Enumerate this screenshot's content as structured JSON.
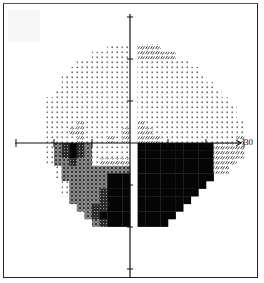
{
  "chart_data": {
    "type": "heatmap",
    "title": "",
    "subtitle": "",
    "xlabel": "",
    "ylabel": "",
    "axis_range_degrees": [
      -30,
      30
    ],
    "tick_spacing_degrees": 10,
    "tick_labels": [
      "30"
    ],
    "grid": false,
    "legend": [],
    "cell_size_px": 7.6,
    "origin_px": [
      130,
      143
    ],
    "col_start": -15,
    "row_start": -17,
    "tone_key": {
      ".": "empty",
      "d": "light-dots (normal sensitivity)",
      "s": "sparse hatch (mild depression)",
      "h": "medium crosshatch (moderate depression)",
      "g": "dark grey (severe depression)",
      "b": "black (absolute defect)"
    },
    "rows": [
      "..............................",
      "..............................",
      "..............................",
      "..............................",
      "............ddd.sss...........",
      "..........ddddd.sssss.........",
      "........ddddddd.ddddddd.......",
      ".......dddddddd.dddddddd......",
      "......ddddddddd.ddddddddd.....",
      "......ddddddddd.dddddddddd....",
      ".....dddddddddd.ddddddddddd...",
      "....ddddddddddd.dddddddddddd..",
      "....ddddddddddd.ddddddddddddd.",
      "....ddddddddddd.ddddddddddddd.",
      "....ddddsdddddd.sddddddddddddd",
      "....dddssddddds.ssdddddddddddd",
      "....ddddsdddsds.sssdddddddddds",
      "....dhgbghddddd.bbbbbbbbbbssss",
      "....dhgbghddddd.bbbbbbbbbbssss",
      "....dhhghhdssss.bbbbbbbbbbsss.",
      ".....dhhhhhhhhh.bbbbbbbbbbss..",
      ".....dhhhhhhbbb.bbbbbbbbbb....",
      "......dhhhhhbbb.bbbbbbbbb.....",
      "......dhhhhgbbb.bbbbbbbb......",
      ".......hhhhgbbb.bbbbbbb.......",
      "........hhggbbb.bbbbbb........",
      ".........hgbbbb.bbbbb.........",
      "..........hgbbb.bbbb..........",
      "..............................",
      ".............................."
    ]
  },
  "axes": {
    "horizontal_tick_label": "30"
  }
}
